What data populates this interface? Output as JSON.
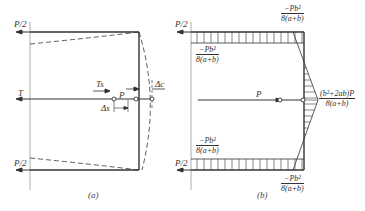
{
  "diagram_a": {
    "caption": "(a)",
    "labels": {
      "load_top": "P/2",
      "load_bottom": "P/2",
      "tension": "T",
      "ts": "Ts",
      "p": "P",
      "delta_s": "Δs",
      "delta_c": "Δc"
    }
  },
  "diagram_b": {
    "caption": "(b)",
    "labels": {
      "load_top": "P/2",
      "load_bottom": "P/2",
      "p": "P",
      "top_corner_num": "−Pb²",
      "top_corner_den": "8(a+b)",
      "top_left_num": "−Pb²",
      "top_left_den": "8(a+b)",
      "mid_right_num": "(b²+2ab)P",
      "mid_right_den": "8(a+b)",
      "bottom_left_num": "−Pb²",
      "bottom_left_den": "8(a+b)",
      "bottom_corner_num": "−Pb²",
      "bottom_corner_den": "8(a+b)"
    }
  }
}
